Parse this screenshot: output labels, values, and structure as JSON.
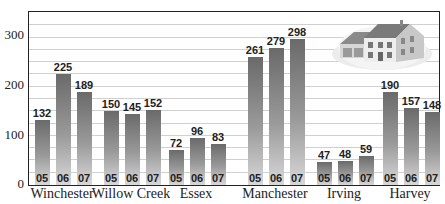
{
  "chart_data": {
    "type": "bar",
    "title": "",
    "xlabel": "",
    "ylabel": "",
    "ylim": [
      0,
      350
    ],
    "yticks": [
      0,
      100,
      200,
      300
    ],
    "grid": true,
    "grid_step": 25,
    "categories": [
      "Winchester",
      "Willow Creek",
      "Essex",
      "Manchester",
      "Irving",
      "Harvey"
    ],
    "series": [
      {
        "name": "05",
        "values": [
          132,
          150,
          72,
          261,
          47,
          190
        ]
      },
      {
        "name": "06",
        "values": [
          225,
          145,
          96,
          279,
          48,
          157
        ]
      },
      {
        "name": "07",
        "values": [
          189,
          152,
          83,
          298,
          59,
          148
        ]
      }
    ],
    "legend": "none",
    "annotations": [
      "house illustration top-right"
    ]
  },
  "axis": {
    "ticks": [
      "0",
      "100",
      "200",
      "300"
    ]
  },
  "groups": [
    {
      "name": "Winchester",
      "bars": [
        {
          "year": "05",
          "value": "132"
        },
        {
          "year": "06",
          "value": "225"
        },
        {
          "year": "07",
          "value": "189"
        }
      ]
    },
    {
      "name": "Willow Creek",
      "bars": [
        {
          "year": "05",
          "value": "150"
        },
        {
          "year": "06",
          "value": "145"
        },
        {
          "year": "07",
          "value": "152"
        }
      ]
    },
    {
      "name": "Essex",
      "bars": [
        {
          "year": "05",
          "value": "72"
        },
        {
          "year": "06",
          "value": "96"
        },
        {
          "year": "07",
          "value": "83"
        }
      ]
    },
    {
      "name": "Manchester",
      "bars": [
        {
          "year": "05",
          "value": "261"
        },
        {
          "year": "06",
          "value": "279"
        },
        {
          "year": "07",
          "value": "298"
        }
      ]
    },
    {
      "name": "Irving",
      "bars": [
        {
          "year": "05",
          "value": "47"
        },
        {
          "year": "06",
          "value": "48"
        },
        {
          "year": "07",
          "value": "59"
        }
      ]
    },
    {
      "name": "Harvey",
      "bars": [
        {
          "year": "05",
          "value": "190"
        },
        {
          "year": "06",
          "value": "157"
        },
        {
          "year": "07",
          "value": "148"
        }
      ]
    }
  ],
  "colors": {
    "bar_top": "#6a6a6a",
    "bar_bottom": "#d8d8d8",
    "grid": "#d0d0d0",
    "axis": "#222222"
  }
}
